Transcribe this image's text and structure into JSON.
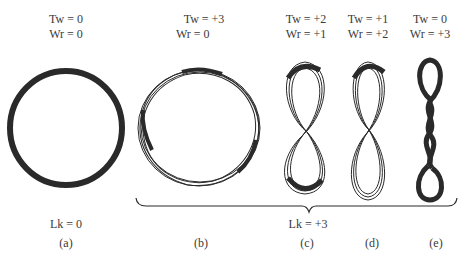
{
  "panels": [
    {
      "id": "a",
      "tw": "Tw = 0",
      "wr": "Wr = 0",
      "caption": "(a)",
      "shape": "relaxed-circle"
    },
    {
      "id": "b",
      "tw": "Tw = +3",
      "wr": "Wr = 0",
      "caption": "(b)",
      "shape": "twisted-circle"
    },
    {
      "id": "c",
      "tw": "Tw = +2",
      "wr": "Wr = +1",
      "caption": "(c)",
      "shape": "figure-eight-ribbon"
    },
    {
      "id": "d",
      "tw": "Tw = +1",
      "wr": "Wr = +2",
      "caption": "(d)",
      "shape": "figure-eight-ribbon-twisted"
    },
    {
      "id": "e",
      "tw": "Tw = 0",
      "wr": "Wr = +3",
      "caption": "(e)",
      "shape": "supercoiled-loop"
    }
  ],
  "linking": {
    "a": "Lk = 0",
    "group_bcde": "Lk = +3"
  },
  "colors": {
    "ink": "#2a2a2a",
    "text": "#3a3a3a",
    "background": "#ffffff"
  }
}
